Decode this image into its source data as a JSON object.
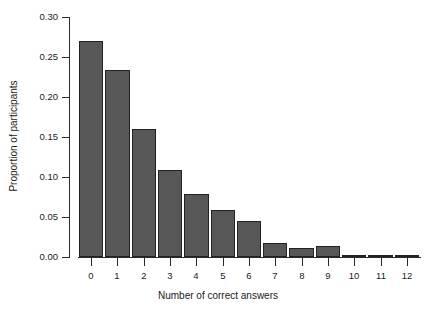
{
  "chart_data": {
    "type": "bar",
    "title": "",
    "subtitle": "",
    "xlabel": "Number of correct answers",
    "ylabel": "Proportion of participants",
    "categories": [
      "0",
      "1",
      "2",
      "3",
      "4",
      "5",
      "6",
      "7",
      "8",
      "9",
      "10",
      "11",
      "12"
    ],
    "values": [
      0.27,
      0.234,
      0.16,
      0.109,
      0.079,
      0.059,
      0.045,
      0.017,
      0.011,
      0.014,
      0.001,
      0.003,
      0.001
    ],
    "ylim": [
      0.0,
      0.3
    ],
    "ytick_labels": [
      "0.00",
      "0.05",
      "0.10",
      "0.15",
      "0.20",
      "0.25",
      "0.30"
    ],
    "ytick_values": [
      0.0,
      0.05,
      0.1,
      0.15,
      0.2,
      0.25,
      0.3
    ],
    "xtick_labels": [
      "0",
      "1",
      "2",
      "3",
      "4",
      "5",
      "6",
      "7",
      "8",
      "9",
      "10",
      "11",
      "12"
    ],
    "grid": false,
    "legend": null,
    "legend_position": "none",
    "annotations": [],
    "colors": {
      "bar_fill": "#575757",
      "bar_border": "#222222",
      "axis": "#2b2b2b",
      "text": "#1a1a1a",
      "background": "#ffffff"
    }
  }
}
